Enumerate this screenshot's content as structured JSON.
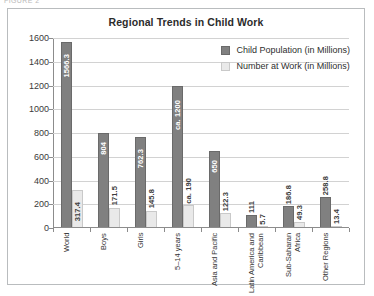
{
  "caption": "FIGURE 2",
  "chart_data": {
    "type": "bar",
    "title": "Regional Trends in Child Work",
    "xlabel": "",
    "ylabel": "",
    "ylim": [
      0,
      1600
    ],
    "yticks": [
      0,
      200,
      400,
      600,
      800,
      1000,
      1200,
      1400,
      1600
    ],
    "grid": true,
    "legend_position": "top-right",
    "categories": [
      "World",
      "Boys",
      "Girls",
      "5–14 years",
      "Asia and Pacific",
      "Latin America and\nCaribbean",
      "Sub-Saharan Africa",
      "Other Regions"
    ],
    "series": [
      {
        "name": "Child Population (in Millions)",
        "color": "#808080",
        "values": [
          1566.3,
          804,
          762.3,
          1200,
          650,
          111,
          186.8,
          258.8
        ],
        "labels": [
          "1566.3",
          "804",
          "762.3",
          "ca. 1200",
          "650",
          "111",
          "186.8",
          "258.8"
        ]
      },
      {
        "name": "Number at Work (in Millions)",
        "color": "#e9e9e9",
        "values": [
          317.4,
          171.5,
          145.8,
          190,
          122.3,
          5.7,
          49.3,
          13.4
        ],
        "labels": [
          "317.4",
          "171.5",
          "145.8",
          "ca. 190",
          "122.3",
          "5.7",
          "49.3",
          "13.4"
        ]
      }
    ]
  }
}
